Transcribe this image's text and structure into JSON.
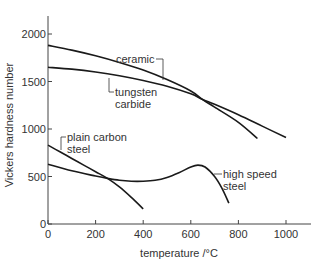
{
  "chart_data": {
    "type": "line",
    "title": "",
    "xlabel": "temperature /°C",
    "ylabel": "Vickers hardness number",
    "xlim": [
      0,
      1100
    ],
    "ylim": [
      0,
      2200
    ],
    "xticks": [
      0,
      200,
      400,
      600,
      800,
      1000
    ],
    "yticks": [
      0,
      500,
      1000,
      1500,
      2000
    ],
    "grid": false,
    "legend": "inline labels",
    "series": [
      {
        "name": "ceramic",
        "label": "ceramic",
        "x": [
          0,
          100,
          200,
          300,
          400,
          500,
          600,
          650,
          700,
          800,
          880
        ],
        "y": [
          1880,
          1830,
          1770,
          1700,
          1620,
          1520,
          1400,
          1310,
          1230,
          1070,
          900
        ]
      },
      {
        "name": "tungsten carbide",
        "label": "tungsten carbide",
        "x": [
          0,
          100,
          200,
          300,
          400,
          500,
          600,
          650,
          700,
          800,
          900,
          1000
        ],
        "y": [
          1650,
          1630,
          1600,
          1560,
          1510,
          1450,
          1370,
          1310,
          1260,
          1150,
          1030,
          910
        ]
      },
      {
        "name": "plain carbon steel",
        "label": "plain carbon steel",
        "x": [
          0,
          50,
          100,
          150,
          200,
          250,
          300,
          350,
          400
        ],
        "y": [
          830,
          760,
          690,
          620,
          550,
          480,
          390,
          280,
          160
        ]
      },
      {
        "name": "high speed steel",
        "label": "high speed steel",
        "x": [
          0,
          100,
          200,
          250,
          300,
          350,
          400,
          450,
          500,
          550,
          600,
          630,
          660,
          700,
          730,
          760
        ],
        "y": [
          630,
          560,
          505,
          480,
          460,
          450,
          450,
          460,
          490,
          540,
          600,
          620,
          600,
          500,
          380,
          220
        ]
      }
    ]
  },
  "labels": {
    "ceramic": "ceramic",
    "tungsten_1": "tungsten",
    "tungsten_2": "carbide",
    "plain_1": "plain carbon",
    "plain_2": "steel",
    "hss_1": "high speed",
    "hss_2": "steel",
    "xlabel": "temperature /°C",
    "ylabel": "Vickers hardness number"
  },
  "ticks": {
    "x": [
      "0",
      "200",
      "400",
      "600",
      "800",
      "1000"
    ],
    "y": [
      "0",
      "500",
      "1000",
      "1500",
      "2000"
    ]
  }
}
